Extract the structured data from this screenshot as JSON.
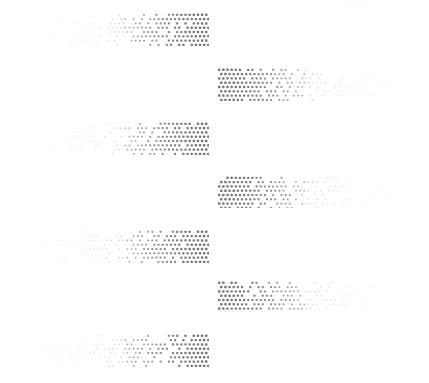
{
  "document": {
    "title": "Halftone dot gradient bands",
    "background_color": "#ffffff",
    "width": 429,
    "height": 383,
    "faint_header_text": "-------- ---",
    "faint_header_color": "#fbfbfc"
  },
  "ink": {
    "dot_color": "#77787c",
    "dot_color_light": "#b9babd",
    "max_dot_radius": 1.45,
    "min_dot_radius": 0.3
  },
  "chart_data": {
    "type": "heatmap",
    "xlabel": "",
    "ylabel": "",
    "grid": false,
    "legend": null,
    "dot_pitch_x": 4.15,
    "dot_pitch_y": 4.3,
    "categories": [
      "band-1",
      "band-2",
      "band-3",
      "band-4",
      "band-5",
      "band-6",
      "band-7"
    ],
    "values": [
      1,
      2,
      3,
      4,
      5,
      6,
      7
    ],
    "bands": [
      {
        "id": "band-1",
        "align": "left",
        "x": 10,
        "y": 12,
        "width": 199,
        "height": 34,
        "rows": 8,
        "density_start": 0.05,
        "density_end": 1.0,
        "direction": "increasing-right"
      },
      {
        "id": "band-2",
        "align": "right",
        "x": 218,
        "y": 67,
        "width": 207,
        "height": 34,
        "rows": 8,
        "density_start": 1.0,
        "density_end": 0.05,
        "direction": "decreasing-right"
      },
      {
        "id": "band-3",
        "align": "left",
        "x": 10,
        "y": 121,
        "width": 199,
        "height": 34,
        "rows": 8,
        "density_start": 0.05,
        "density_end": 1.0,
        "direction": "increasing-right"
      },
      {
        "id": "band-4",
        "align": "right",
        "x": 218,
        "y": 175,
        "width": 207,
        "height": 33,
        "rows": 8,
        "density_start": 1.0,
        "density_end": 0.05,
        "direction": "decreasing-right"
      },
      {
        "id": "band-5",
        "align": "left",
        "x": 10,
        "y": 229,
        "width": 199,
        "height": 34,
        "rows": 8,
        "density_start": 0.05,
        "density_end": 1.0,
        "direction": "increasing-right"
      },
      {
        "id": "band-6",
        "align": "right",
        "x": 218,
        "y": 280,
        "width": 207,
        "height": 32,
        "rows": 8,
        "density_start": 1.0,
        "density_end": 0.05,
        "direction": "decreasing-right"
      },
      {
        "id": "band-7",
        "align": "left",
        "x": 10,
        "y": 333,
        "width": 199,
        "height": 34,
        "rows": 8,
        "density_start": 0.05,
        "density_end": 1.0,
        "direction": "increasing-right"
      }
    ]
  }
}
